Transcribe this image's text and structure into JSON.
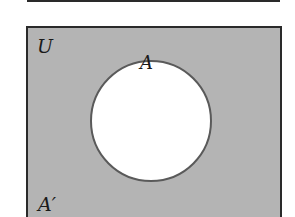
{
  "diagram": {
    "type": "venn",
    "universal_label": "U",
    "set_label": "A",
    "complement_label": "A′",
    "shaded_region": "complement of A",
    "colors": {
      "shade": "#b4b4b4",
      "set_fill": "#ffffff",
      "border": "#2a2a2a",
      "circle_stroke": "#555555"
    }
  }
}
